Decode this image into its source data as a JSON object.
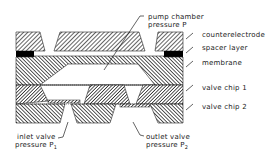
{
  "diagram": {
    "labels": {
      "pump_chamber": {
        "line1": "pump chamber",
        "line2": "pressure P"
      },
      "counterelectrode": "counterelectrode",
      "spacer_layer": "spacer layer",
      "membrane": "membrane",
      "valve_chip_1": "valve chip 1",
      "valve_chip_2": "valve chip 2",
      "inlet_valve": {
        "line1": "inlet valve",
        "line2": "pressure P",
        "subscript": "1"
      },
      "outlet_valve": {
        "line1": "outlet valve",
        "line2": "pressure P",
        "subscript": "2"
      }
    },
    "colors": {
      "hatch_fill": "#333333",
      "spacer_fill": "#000000",
      "background": "#ffffff"
    }
  }
}
